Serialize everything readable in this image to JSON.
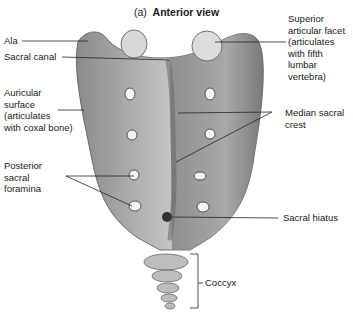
{
  "figure": {
    "title_prefix": "(a)",
    "title": "Anterior view"
  },
  "labels": {
    "ala": "Ala",
    "sacral_canal": "Sacral canal",
    "auricular_surface": "Auricular\nsurface\n(articulates\nwith coxal bone)",
    "posterior_sacral_foramina": "Posterior\nsacral\nforamina",
    "superior_articular_facet": "Superior\narticular facet\n(articulates\nwith fifth\nlumbar\nvertebra)",
    "median_sacral_crest": "Median sacral\ncrest",
    "sacral_hiatus": "Sacral hiatus",
    "coccyx": "Coccyx"
  }
}
